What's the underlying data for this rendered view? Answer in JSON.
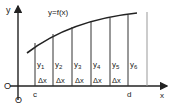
{
  "diagram": {
    "curve_label": "y=f(x)",
    "y_axis_label": "y",
    "x_axis_label": "x",
    "origin_label": "O",
    "origin_label_below": "O",
    "start_label": "c",
    "end_label": "d",
    "ordinates": [
      "y1",
      "y2",
      "y3",
      "y4",
      "y5",
      "y6"
    ],
    "ordinate_labels": [
      {
        "base": "y",
        "sub": "1"
      },
      {
        "base": "y",
        "sub": "2"
      },
      {
        "base": "y",
        "sub": "3"
      },
      {
        "base": "y",
        "sub": "4"
      },
      {
        "base": "y",
        "sub": "5"
      },
      {
        "base": "y",
        "sub": "6"
      }
    ],
    "interval_label": "Δx",
    "interval_count": 6,
    "line_color": "#222222"
  }
}
